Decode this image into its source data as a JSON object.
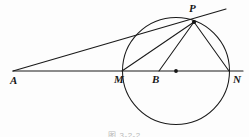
{
  "figure": {
    "kind": "geometry-diagram",
    "background_color": "#fdfdfd",
    "stroke_color": "#1a1a1a",
    "label_color": "#171717",
    "caption": "图 3-2-2",
    "points": [
      {
        "id": "A",
        "label": "A",
        "x": 13,
        "y": 71,
        "label_x": 10,
        "label_y": 75,
        "marker": "none"
      },
      {
        "id": "M",
        "label": "M",
        "x": 122,
        "y": 71,
        "label_x": 114,
        "label_y": 74,
        "marker": "none"
      },
      {
        "id": "B",
        "label": "B",
        "x": 159,
        "y": 71,
        "label_x": 152,
        "label_y": 74,
        "marker": "none"
      },
      {
        "id": "O",
        "label": "",
        "x": 176,
        "y": 71,
        "label_x": 0,
        "label_y": 0,
        "marker": "dot"
      },
      {
        "id": "N",
        "label": "N",
        "x": 229,
        "y": 71,
        "label_x": 233,
        "label_y": 74,
        "marker": "none"
      },
      {
        "id": "P",
        "label": "P",
        "x": 194,
        "y": 22,
        "label_x": 189,
        "label_y": 3,
        "marker": "dot"
      }
    ],
    "circle": {
      "cx": 176,
      "cy": 71,
      "r": 53.5
    },
    "segments": [
      {
        "id": "axis-AN",
        "name": "line-A-to-N",
        "x1": 13,
        "y1": 71,
        "x2": 243,
        "y2": 71
      },
      {
        "id": "tangent-AP",
        "name": "tangent-line-A-P",
        "x1": 13,
        "y1": 71,
        "x2": 226,
        "y2": 9
      },
      {
        "id": "chord-PM",
        "name": "chord-P-to-M",
        "x1": 194,
        "y1": 22,
        "x2": 122,
        "y2": 71
      },
      {
        "id": "seg-PB",
        "name": "segment-P-to-B",
        "x1": 194,
        "y1": 22,
        "x2": 159,
        "y2": 71
      },
      {
        "id": "chord-PN",
        "name": "chord-P-to-N",
        "x1": 194,
        "y1": 22,
        "x2": 229,
        "y2": 71
      }
    ]
  }
}
